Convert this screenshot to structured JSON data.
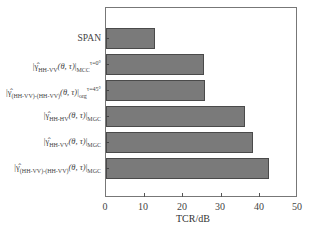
{
  "chart_data": {
    "type": "bar",
    "orientation": "horizontal",
    "title": "",
    "xlabel": "TCR/dB",
    "ylabel": "",
    "xlim": [
      0,
      50
    ],
    "xticks": [
      0,
      10,
      20,
      30,
      40,
      50
    ],
    "grid": false,
    "legend": null,
    "categories": [
      "SPAN",
      "|γ̂HH-VV(θ, τ)|MCC^τ=0°",
      "|γ̂(HH-VV)-(HH-VV)(θ, τ)|org^τ=45°",
      "|γ̂HH-HV(θ, τ)|MGC",
      "|γ̂HH-VV(θ, τ)|MGC",
      "|γ̂(HH-VV)-(HH-VV)(θ, τ)|MGC"
    ],
    "values": [
      13,
      25.8,
      26,
      36.7,
      38.8,
      43
    ],
    "bar_color": "#7a7a7a"
  },
  "axis": {
    "xlabel": "TCR/dB",
    "ticks": [
      "0",
      "10",
      "20",
      "30",
      "40",
      "50"
    ]
  },
  "labels": {
    "span": "SPAN",
    "gamma": "γ̂",
    "theta_tau": "(θ, τ)",
    "l2_sub": "HH-VV",
    "l2_post": "MCC",
    "l2_sup": "τ=0°",
    "l3_sub": "(HH-VV)-(HH-VV)",
    "l3_post": "org",
    "l3_sup": "τ=45°",
    "l4_sub": "HH-HV",
    "l4_post": "MGC",
    "l5_sub": "HH-VV",
    "l5_post": "MGC",
    "l6_sub": "(HH-VV)-(HH-VV)",
    "l6_post": "MGC"
  }
}
